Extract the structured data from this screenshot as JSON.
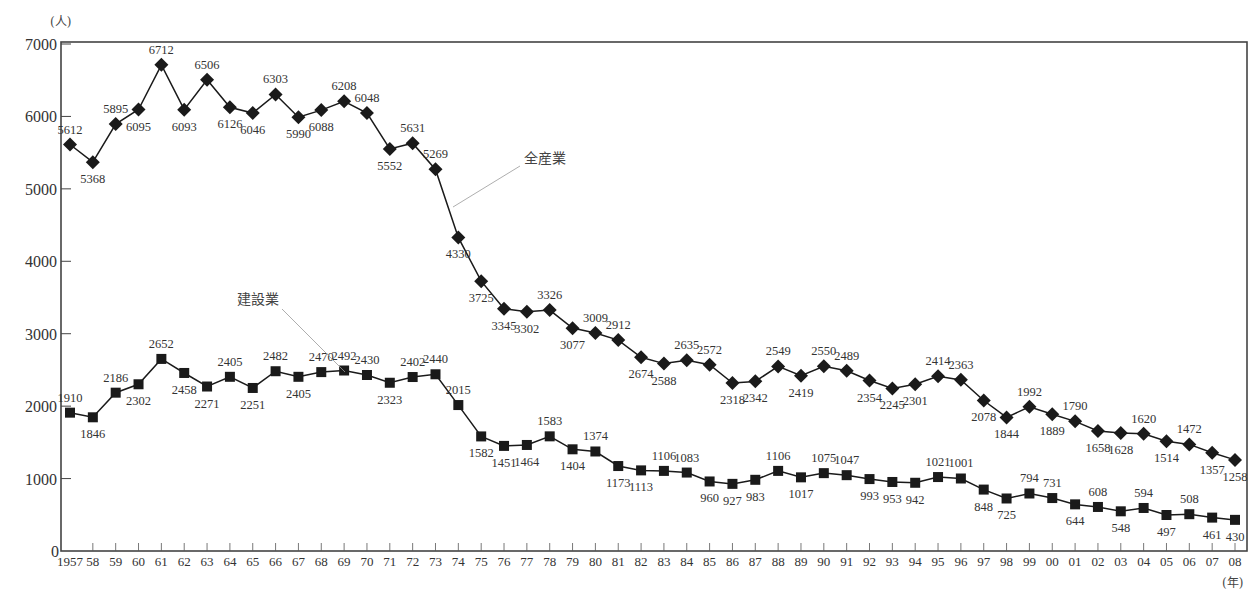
{
  "chart_data": {
    "type": "line",
    "title": "",
    "ylabel": "(人)",
    "xlabel": "(年)",
    "ylim": [
      0,
      7000
    ],
    "yticks": [
      0,
      1000,
      2000,
      3000,
      4000,
      5000,
      6000,
      7000
    ],
    "grid": false,
    "categories": [
      "1957",
      "58",
      "59",
      "60",
      "61",
      "62",
      "63",
      "64",
      "65",
      "66",
      "67",
      "68",
      "69",
      "70",
      "71",
      "72",
      "73",
      "74",
      "75",
      "76",
      "77",
      "78",
      "79",
      "80",
      "81",
      "82",
      "83",
      "84",
      "85",
      "86",
      "87",
      "88",
      "89",
      "90",
      "91",
      "92",
      "93",
      "94",
      "95",
      "96",
      "97",
      "98",
      "99",
      "00",
      "01",
      "02",
      "03",
      "04",
      "05",
      "06",
      "07",
      "08"
    ],
    "series": [
      {
        "name": "全産業",
        "marker": "diamond",
        "color": "#1a1a1a",
        "values": [
          5612,
          5368,
          5895,
          6095,
          6712,
          6093,
          6506,
          6126,
          6046,
          6303,
          5990,
          6088,
          6208,
          6048,
          5552,
          5631,
          5269,
          4330,
          3725,
          3345,
          3302,
          3326,
          3077,
          3009,
          2912,
          2674,
          2588,
          2635,
          2572,
          2318,
          2342,
          2549,
          2419,
          2550,
          2489,
          2354,
          2245,
          2301,
          2414,
          2363,
          2078,
          1844,
          1992,
          1889,
          1790,
          1658,
          1628,
          1620,
          1514,
          1472,
          1357,
          1258
        ]
      },
      {
        "name": "建設業",
        "marker": "square",
        "color": "#1a1a1a",
        "values": [
          1910,
          1846,
          2186,
          2302,
          2652,
          2458,
          2271,
          2405,
          2251,
          2482,
          2405,
          2470,
          2492,
          2430,
          2323,
          2402,
          2440,
          2015,
          1582,
          1451,
          1464,
          1583,
          1404,
          1374,
          1173,
          1113,
          1106,
          1083,
          960,
          927,
          983,
          1106,
          1017,
          1075,
          1047,
          993,
          953,
          942,
          1021,
          1001,
          848,
          725,
          794,
          731,
          644,
          608,
          548,
          594,
          497,
          508,
          461,
          430
        ]
      }
    ],
    "annotations": [
      {
        "text": "全産業",
        "series": 0
      },
      {
        "text": "建設業",
        "series": 1
      }
    ]
  }
}
